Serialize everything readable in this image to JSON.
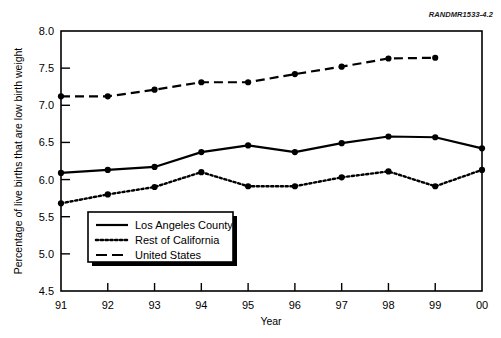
{
  "figure": {
    "id_prefix": "RANDMR",
    "id_number": "1533-4.2",
    "id_full": "RANDMR1533-4.2"
  },
  "chart_data": {
    "type": "line",
    "title": "",
    "xlabel": "Year",
    "ylabel": "Percentage of live births that are low birth weight",
    "categories": [
      "91",
      "92",
      "93",
      "94",
      "95",
      "96",
      "97",
      "98",
      "99",
      "00"
    ],
    "x_ticklabels": [
      "91",
      "92",
      "93",
      "94",
      "95",
      "96",
      "97",
      "98",
      "99",
      "00"
    ],
    "y_ticklabels": [
      "4.5",
      "5.0",
      "5.5",
      "6.0",
      "6.5",
      "7.0",
      "7.5",
      "8.0"
    ],
    "y_ticks": [
      4.5,
      5.0,
      5.5,
      6.0,
      6.5,
      7.0,
      7.5,
      8.0
    ],
    "ylim": [
      4.5,
      8.0
    ],
    "grid": false,
    "legend_position": "lower-left-inside",
    "series": [
      {
        "name": "Los Angeles County",
        "style": "solid",
        "marker": "circle",
        "color": "#000000",
        "values": [
          6.09,
          6.13,
          6.17,
          6.37,
          6.46,
          6.37,
          6.49,
          6.58,
          6.57,
          6.42
        ]
      },
      {
        "name": "Rest of California",
        "style": "dotted",
        "marker": "circle",
        "color": "#000000",
        "values": [
          5.68,
          5.8,
          5.9,
          6.1,
          5.91,
          5.91,
          6.03,
          6.11,
          5.91,
          6.13
        ]
      },
      {
        "name": "United States",
        "style": "dashed",
        "marker": "circle",
        "color": "#000000",
        "values": [
          7.12,
          7.12,
          7.21,
          7.31,
          7.31,
          7.42,
          7.52,
          7.63,
          7.64,
          null
        ]
      }
    ]
  },
  "legend": {
    "items": [
      {
        "label": "Los Angeles County",
        "style": "solid"
      },
      {
        "label": "Rest of California",
        "style": "dotted"
      },
      {
        "label": "United States",
        "style": "dashed"
      }
    ]
  }
}
